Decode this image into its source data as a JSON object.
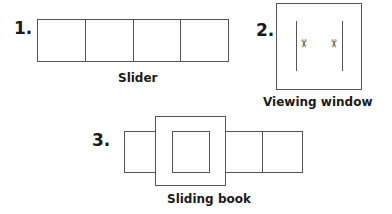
{
  "figures": [
    {
      "number": "1.",
      "caption": "Slider",
      "cells": 4
    },
    {
      "number": "2.",
      "caption": "Viewing window",
      "icons": [
        "scissors-icon",
        "scissors-icon"
      ]
    },
    {
      "number": "3.",
      "caption": "Sliding book"
    }
  ],
  "glyphs": {
    "scissors": "✂"
  }
}
